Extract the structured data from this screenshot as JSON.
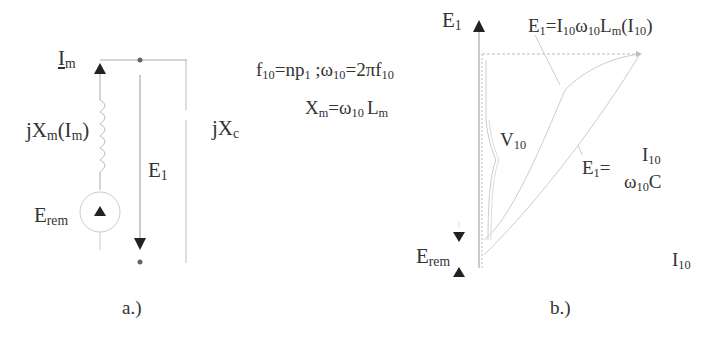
{
  "panel_a": {
    "caption": "a.)",
    "im_label": "I",
    "im_sub": "m",
    "inductor_label_pre": "jX",
    "inductor_label_sub": "m",
    "inductor_label_paren": "(I",
    "inductor_label_paren_sub": "m",
    "inductor_label_close": ")",
    "e1_label": "E",
    "e1_sub": "1",
    "erem_label": "E",
    "erem_sub": "rem",
    "cap_label": "jX",
    "cap_sub": "c"
  },
  "equations": {
    "line1": {
      "f": "f",
      "f_sub": "10",
      "eq1": "=np",
      "p_sub": "1",
      "sep": " ;ω",
      "w_sub": "10",
      "eq2": "=2πf",
      "f2_sub": "10"
    },
    "line2": {
      "x": "X",
      "x_sub": "m",
      "eq": "=ω",
      "w_sub": "10",
      "l": "L",
      "l_sub": "m"
    }
  },
  "panel_b": {
    "caption": "b.)",
    "axis_y_label": "E",
    "axis_y_sub": "1",
    "axis_x_label": "I",
    "axis_x_sub": "10",
    "curve1_label": "E",
    "curve1_sub": "1",
    "curve1_eq": "=I",
    "curve1_i_sub": "10",
    "curve1_w": "ω",
    "curve1_w_sub": "10",
    "curve1_l": "L",
    "curve1_l_sub": "m",
    "curve1_paren": "(I",
    "curve1_paren_sub": "10",
    "curve1_close": ")",
    "curve2_label": "E",
    "curve2_sub": "1",
    "curve2_eq": "=",
    "curve2_num": "I",
    "curve2_num_sub": "10",
    "curve2_den": "ω",
    "curve2_den_sub": "10",
    "curve2_den_c": "C",
    "v10_label": "V",
    "v10_sub": "10",
    "erem_label": "E",
    "erem_sub": "rem"
  }
}
